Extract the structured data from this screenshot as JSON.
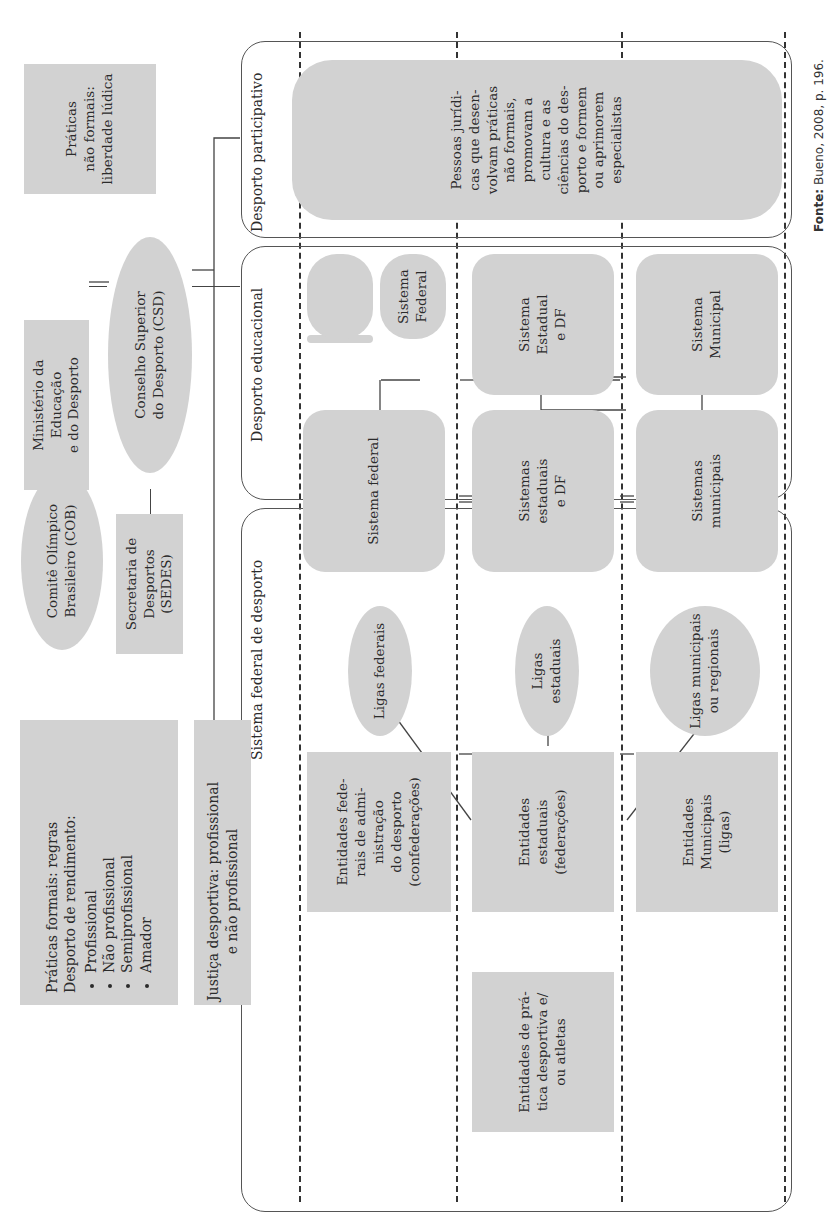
{
  "outer_nodes": {
    "praticas_nao_formais": "Práticas\nnão formais:\nliberdade lúdica",
    "ministerio": "Ministério da Educação\ne do Desporto",
    "conselho": "Conselho Superior\ndo Desporto (CSD)",
    "cob": "Comitê Olímpico\nBrasileiro (COB)",
    "sedes": "Secretaria de Desportos\n(SEDES)",
    "praticas_formais": {
      "line1": "Práticas formais: regras",
      "line2": "Desporto de rendimento:",
      "items": [
        "Profissional",
        "Não profissional",
        "Semiprofissional",
        "Amador"
      ]
    },
    "justica": "Justiça desportiva: profissional\ne não profissional"
  },
  "frames": {
    "participativo": {
      "title": "Desporto participativo",
      "node": "Pessoas jurídi-\ncas que desen-\nvolvam práticas\nnão formais,\npromovam a\ncultura e as\nciências do des-\nporto e formem\nou aprimorem\nespecialistas"
    },
    "educacional": {
      "title": "Desporto educacional",
      "nodes": {
        "universitario": "Desporto\nUniversitário",
        "sistema_federal": "Sistema\nFederal",
        "sistema_estadual": "Sistema\nEstadual\ne DF",
        "sistema_municipal": "Sistema\nMunicipal"
      }
    },
    "federal": {
      "title": "Sistema federal de desporto",
      "nodes": {
        "sistema_federal": "Sistema federal",
        "sistemas_estaduais": "Sistemas\nestaduais\ne DF",
        "sistemas_municipais": "Sistemas\nmunicipais",
        "ligas_federais": "Ligas federais",
        "ligas_estaduais": "Ligas\nestaduais",
        "ligas_municipais": "Ligas municipais\nou regionais",
        "entidades_federais": "Entidades fede-\nrais de admi-\nnistração\ndo desporto\n(confederações)",
        "entidades_estaduais": "Entidades\nestaduais\n(federações)",
        "entidades_municipais": "Entidades\nMunicipais\n(ligas)",
        "entidades_pratica": "Entidades de prá-\ntica desportiva e/\nou atletas"
      }
    }
  },
  "source": {
    "label": "Fonte:",
    "text": " Bueno, 2008, p. 196."
  }
}
